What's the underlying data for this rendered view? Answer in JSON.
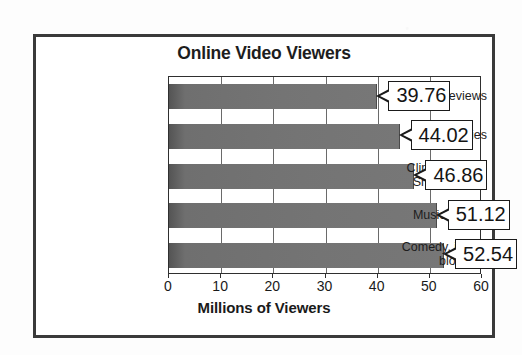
{
  "chart_data": {
    "type": "bar",
    "orientation": "horizontal",
    "title": "Online Video Viewers",
    "xlabel": "Millions of Viewers",
    "ylabel": "",
    "xlim": [
      0,
      60
    ],
    "xticks": [
      "0",
      "10",
      "20",
      "30",
      "40",
      "50",
      "60"
    ],
    "grid": true,
    "legend": "none",
    "categories": [
      "Movie Previews",
      "News Stories",
      "Clips on Video Sharing Sites",
      "Music Videos",
      "Comedy, jokes, bloopers"
    ],
    "category_lines": [
      [
        "Movie Previews"
      ],
      [
        "News Stories"
      ],
      [
        "Clips on Video",
        "Sharing Sites"
      ],
      [
        "Music Videos"
      ],
      [
        "Comedy, jokes,",
        "bloopers"
      ]
    ],
    "values": [
      39.76,
      44.02,
      46.86,
      51.12,
      52.54
    ],
    "value_labels": [
      "39.76",
      "44.02",
      "46.86",
      "51.12",
      "52.54"
    ],
    "bar_color": "#717171",
    "frame_color": "#3a3a3a",
    "text_color": "#1a1a1a"
  }
}
